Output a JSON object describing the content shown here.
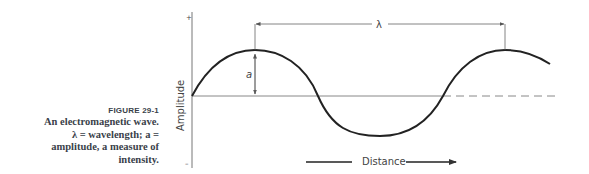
{
  "figure": {
    "label": "FIGURE 29-1",
    "caption_lines": [
      "An electromagnetic wave.",
      "λ = wavelength; a =",
      "amplitude, a measure of",
      "intensity."
    ]
  },
  "diagram": {
    "y_axis_label": "Amplitude",
    "y_axis_plus": "+",
    "y_axis_minus": "–",
    "x_axis_label": "Distance",
    "wavelength_symbol": "λ",
    "amplitude_symbol": "a",
    "colors": {
      "curve": "#222222",
      "axis": "#777777",
      "text": "#3a3f4a"
    }
  }
}
